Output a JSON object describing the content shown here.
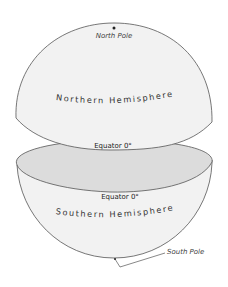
{
  "diagram": {
    "labels": {
      "north_pole": "North Pole",
      "northern_hemisphere": "Northern Hemisphere",
      "equator_upper": "Equator 0°",
      "equator_lower": "Equator 0°",
      "southern_hemisphere": "Southern Hemisphere",
      "south_pole": "South Pole"
    },
    "colors": {
      "outline": "#555555",
      "hemisphere_fill": "#f2f2f2",
      "equator_plane_fill": "#dcdcdc",
      "background": "#ffffff"
    }
  }
}
